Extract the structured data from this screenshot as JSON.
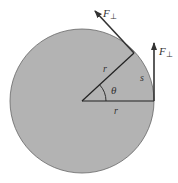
{
  "diagram": {
    "labels": {
      "force_tangent": "F",
      "force_tangent_sub": "⊥",
      "force_vertical": "F",
      "force_vertical_sub": "⊥",
      "radius_upper": "r",
      "radius_lower": "r",
      "angle": "θ",
      "arc": "s"
    },
    "colors": {
      "disk_fill": "#b3b3b3",
      "disk_stroke": "#555555",
      "line": "#222222"
    }
  }
}
